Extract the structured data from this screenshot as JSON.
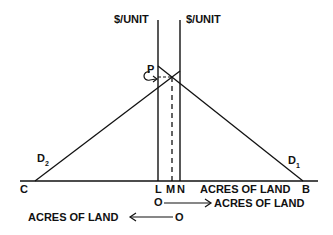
{
  "diagram": {
    "vertical_axis_labels": {
      "left": "$/UNIT",
      "right": "$/UNIT"
    },
    "price_label": "P",
    "curves": {
      "d2": {
        "label": "D",
        "subscript": "2"
      },
      "d1": {
        "label": "D",
        "subscript": "1"
      }
    },
    "points": {
      "c": "C",
      "l": "L",
      "m": "M",
      "n": "N",
      "b": "B"
    },
    "axis_labels": {
      "right_origin": "O",
      "right_axis": "ACRES OF LAND",
      "upper_axis": "ACRES OF LAND",
      "left_origin": "O",
      "left_axis": "ACRES OF LAND"
    },
    "colors": {
      "line": "#111111",
      "background": "#ffffff"
    }
  }
}
